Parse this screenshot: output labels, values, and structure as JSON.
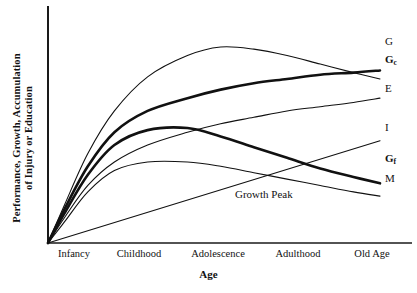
{
  "chart_data": {
    "type": "line",
    "title": "",
    "xlabel": "Age",
    "ylabel": "Performance, Growth, Accumulation of Injury or Education",
    "ylabel_line1": "Performance, Growth, Accumulation",
    "ylabel_line2": "of Injury or Education",
    "grid": false,
    "legend_position": "right-inline-labels",
    "axis_style": "two-axis-open",
    "xlim": [
      0,
      100
    ],
    "ylim": [
      0,
      100
    ],
    "categories": [
      "Infancy",
      "Childhood",
      "Adolescence",
      "Adulthood",
      "Old Age"
    ],
    "category_positions": [
      8,
      28,
      52,
      76,
      95
    ],
    "annotations": [
      {
        "text": "Growth Peak",
        "x": 55,
        "y": 22
      }
    ],
    "series": [
      {
        "name": "G",
        "label": "G",
        "label_bold": false,
        "subscript": "",
        "description": "General intelligence: rises steeply, peaks in adolescence, slow decline",
        "weight": 1.1,
        "color": "#111111",
        "x": [
          0,
          5,
          12,
          20,
          30,
          42,
          52,
          62,
          72,
          82,
          92,
          100
        ],
        "y": [
          0,
          18,
          42,
          62,
          78,
          88,
          92,
          91,
          88,
          84,
          80,
          77
        ]
      },
      {
        "name": "Gc",
        "label": "G",
        "label_bold": true,
        "subscript": "c",
        "description": "Crystallized intelligence: rises and plateaus high, no decline",
        "weight": 2.6,
        "color": "#111111",
        "x": [
          0,
          5,
          12,
          20,
          30,
          42,
          52,
          62,
          72,
          82,
          92,
          100
        ],
        "y": [
          0,
          16,
          36,
          52,
          62,
          68,
          72,
          75,
          77,
          79,
          80,
          81
        ]
      },
      {
        "name": "E",
        "label": "E",
        "label_bold": false,
        "subscript": "",
        "description": "Education: steady accumulation across lifespan",
        "weight": 1.1,
        "color": "#111111",
        "x": [
          0,
          5,
          12,
          20,
          30,
          42,
          52,
          62,
          72,
          82,
          92,
          100
        ],
        "y": [
          0,
          12,
          27,
          38,
          46,
          52,
          56,
          59,
          62,
          64,
          66,
          68
        ]
      },
      {
        "name": "I",
        "label": "I",
        "label_bold": false,
        "subscript": "",
        "description": "Accumulation of injury: near-linear rise from zero",
        "weight": 1.1,
        "color": "#111111",
        "x": [
          0,
          100
        ],
        "y": [
          0,
          48
        ]
      },
      {
        "name": "Gf",
        "label": "G",
        "label_bold": true,
        "subscript": "f",
        "description": "Fluid intelligence: peaks early then declines steadily",
        "weight": 2.6,
        "color": "#111111",
        "x": [
          0,
          5,
          12,
          20,
          30,
          42,
          52,
          62,
          72,
          82,
          92,
          100
        ],
        "y": [
          0,
          14,
          32,
          46,
          53,
          54,
          50,
          45,
          40,
          35,
          31,
          28
        ]
      },
      {
        "name": "M",
        "label": "M",
        "label_bold": false,
        "subscript": "",
        "description": "Maturation/physical: early peak, gentle decline",
        "weight": 1.1,
        "color": "#111111",
        "x": [
          0,
          5,
          12,
          20,
          30,
          42,
          52,
          62,
          72,
          82,
          92,
          100
        ],
        "y": [
          0,
          10,
          24,
          34,
          38,
          38,
          36,
          33,
          30,
          27,
          24,
          22
        ]
      }
    ]
  },
  "axes": {
    "x_title": "Age",
    "y_title_line1": "Performance, Growth, Accumulation",
    "y_title_line2": "of Injury or Education",
    "tick_labels": [
      "Infancy",
      "Childhood",
      "Adolescence",
      "Adulthood",
      "Old Age"
    ]
  },
  "series_labels": [
    {
      "id": "label-g",
      "text": "G",
      "sub": "",
      "bold": false,
      "x": 385,
      "y": 42
    },
    {
      "id": "label-gc",
      "text": "G",
      "sub": "c",
      "bold": true,
      "x": 385,
      "y": 60
    },
    {
      "id": "label-e",
      "text": "E",
      "sub": "",
      "bold": false,
      "x": 385,
      "y": 89
    },
    {
      "id": "label-i",
      "text": "I",
      "sub": "",
      "bold": false,
      "x": 385,
      "y": 128
    },
    {
      "id": "label-gf",
      "text": "G",
      "sub": "f",
      "bold": true,
      "x": 385,
      "y": 159
    },
    {
      "id": "label-m",
      "text": "M",
      "sub": "",
      "bold": false,
      "x": 385,
      "y": 179
    }
  ],
  "annotation": {
    "growth_peak": "Growth Peak"
  },
  "colors": {
    "background": "#ffffff",
    "ink": "#111111",
    "axis": "#1a1a1a"
  }
}
